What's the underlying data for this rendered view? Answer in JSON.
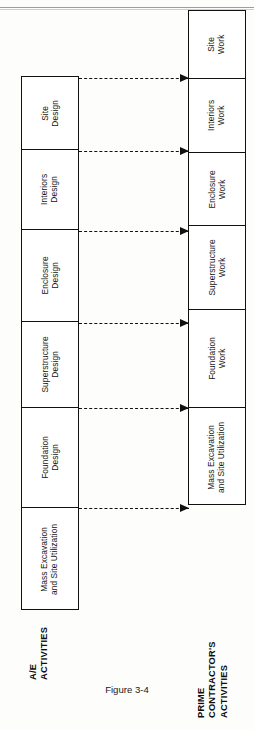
{
  "figure": {
    "caption": "Figure 3-4"
  },
  "columns": {
    "left": {
      "group_label_line1": "A/E",
      "group_label_line2": "ACTIVITIES",
      "cells": [
        {
          "line1": "Site",
          "line2": "Design"
        },
        {
          "line1": "Interiors",
          "line2": "Design"
        },
        {
          "line1": "Enclosure",
          "line2": "Design"
        },
        {
          "line1": "Superstructure",
          "line2": "Design"
        },
        {
          "line1": "Foundation",
          "line2": "Design"
        },
        {
          "line1": "Mass Excavation",
          "line2": "and Site Utilization"
        }
      ]
    },
    "right": {
      "group_label_line1": "PRIME",
      "group_label_line2": "CONTRACTOR'S",
      "group_label_line3": "ACTIVITIES",
      "cells": [
        {
          "line1": "Site",
          "line2": "Work"
        },
        {
          "line1": "Interiors",
          "line2": "Work"
        },
        {
          "line1": "Enclosure",
          "line2": "Work"
        },
        {
          "line1": "Superstructure",
          "line2": "Work"
        },
        {
          "line1": "Foundation",
          "line2": "Work"
        },
        {
          "line1": "Mass Excavation",
          "line2": "and Site Utilization"
        }
      ]
    }
  },
  "connectors": [
    {
      "label": "site-design-to-site-work"
    },
    {
      "label": "interiors-design-to-interiors-work"
    },
    {
      "label": "enclosure-design-to-enclosure-work"
    },
    {
      "label": "superstructure-design-to-superstructure-work"
    },
    {
      "label": "foundation-design-to-foundation-work"
    },
    {
      "label": "mass-excavation-design-to-mass-excavation-work"
    }
  ],
  "colors": {
    "line": "#111111",
    "background": "#ffffff",
    "text": "#141414"
  }
}
